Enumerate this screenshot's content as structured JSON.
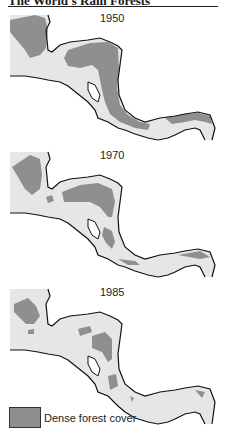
{
  "title": "The World's Rain Forests",
  "maps": [
    {
      "year": "1950"
    },
    {
      "year": "1970"
    },
    {
      "year": "1985"
    }
  ],
  "legend": {
    "label": "Dense forest cover",
    "swatch_color": "#8f8f8f"
  },
  "colors": {
    "land": "#e6e6e6",
    "forest": "#8f8f8f",
    "coast": "#111111"
  }
}
